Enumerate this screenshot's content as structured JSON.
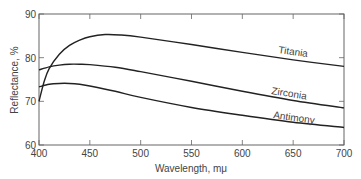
{
  "chart_data": {
    "type": "line",
    "title": "",
    "xlabel": "Wavelength, mμ",
    "ylabel": "Reflectance, %",
    "xlim": [
      400,
      700
    ],
    "ylim": [
      60,
      90
    ],
    "xticks": [
      400,
      450,
      500,
      550,
      600,
      650,
      700
    ],
    "yticks": [
      60,
      70,
      80,
      90
    ],
    "grid": false,
    "legend": "inline labels",
    "series": [
      {
        "name": "Titania",
        "x": [
          400,
          405,
          410,
          420,
          430,
          440,
          450,
          465,
          480,
          500,
          550,
          600,
          650,
          700
        ],
        "values": [
          70.0,
          74.5,
          77.5,
          80.8,
          82.8,
          84.0,
          84.8,
          85.3,
          85.2,
          84.7,
          83.0,
          81.2,
          79.5,
          78.0
        ]
      },
      {
        "name": "Zirconia",
        "x": [
          400,
          410,
          420,
          430,
          440,
          450,
          475,
          500,
          550,
          600,
          650,
          700
        ],
        "values": [
          77.2,
          77.9,
          78.3,
          78.5,
          78.5,
          78.4,
          77.8,
          76.8,
          74.6,
          72.3,
          70.2,
          68.5
        ],
        "label_at": 620
      },
      {
        "name": "Antimony",
        "x": [
          400,
          410,
          420,
          430,
          440,
          450,
          475,
          500,
          550,
          600,
          650,
          700
        ],
        "values": [
          73.3,
          73.9,
          74.1,
          74.1,
          73.9,
          73.5,
          72.3,
          70.9,
          68.6,
          66.8,
          65.2,
          64.0
        ],
        "label_at": 620
      }
    ]
  },
  "labels": {
    "titania": "Titania",
    "zirconia": "Zirconia",
    "antimony": "Antimony",
    "xlabel": "Wavelength, mμ",
    "ylabel": "Reflectance, %"
  }
}
